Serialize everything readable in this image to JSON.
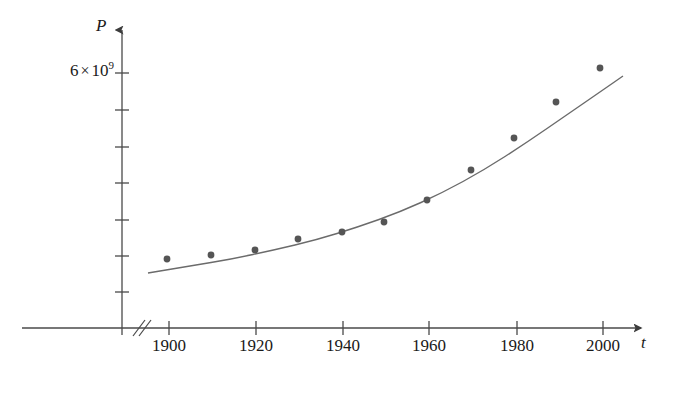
{
  "figure": {
    "background_color": "#ffffff",
    "axis_color": "#4a4a4a",
    "curve_color": "#6b6b6b",
    "point_color": "#555555",
    "text_color": "#1a1a1a"
  },
  "axes": {
    "y_axis_label": "P",
    "x_axis_label": "t",
    "x_axis_break": "//",
    "y_tick_labels": [
      {
        "id": "6e9",
        "mantissa": "6",
        "times": "×",
        "base": "10",
        "exponent": "9",
        "value": 6000000000
      }
    ],
    "x_tick_labels": [
      "1900",
      "1920",
      "1940",
      "1960",
      "1980",
      "2000"
    ]
  },
  "chart_data": {
    "type": "scatter",
    "title": "",
    "subtitle": "",
    "xlabel": "t",
    "ylabel": "P",
    "grid": false,
    "legend": null,
    "xlim": [
      1895,
      2005
    ],
    "ylim": [
      0,
      7000000000
    ],
    "x_ticks": [
      1900,
      1920,
      1940,
      1960,
      1980,
      2000
    ],
    "x_tick_labels": [
      "1900",
      "1920",
      "1940",
      "1960",
      "1980",
      "2000"
    ],
    "y_ticks": [
      1000000000,
      2000000000,
      3000000000,
      4000000000,
      5000000000,
      6000000000,
      7000000000
    ],
    "y_tick_labels": [
      "",
      "",
      "",
      "",
      "",
      "6 × 10⁹",
      ""
    ],
    "x_axis_broken": true,
    "series": [
      {
        "name": "World population",
        "type": "scatter",
        "x": [
          1900,
          1910,
          1920,
          1930,
          1940,
          1950,
          1960,
          1970,
          1980,
          1990,
          2000
        ],
        "y": [
          1650000000,
          1750000000,
          1860000000,
          2070000000,
          2300000000,
          2560000000,
          3040000000,
          3710000000,
          4450000000,
          5280000000,
          6080000000
        ],
        "point_pixels": [
          [
            167,
            259
          ],
          [
            211,
            255
          ],
          [
            255,
            250
          ],
          [
            298,
            239
          ],
          [
            342,
            232
          ],
          [
            384,
            222
          ],
          [
            427,
            200
          ],
          [
            471,
            170
          ],
          [
            514,
            138
          ],
          [
            556,
            102
          ],
          [
            600,
            68
          ]
        ]
      },
      {
        "name": "Fitted exponential model",
        "type": "line",
        "path_pixels": [
          [
            148,
            273
          ],
          [
            190,
            266
          ],
          [
            232,
            259
          ],
          [
            274,
            250
          ],
          [
            316,
            240
          ],
          [
            358,
            227
          ],
          [
            400,
            212
          ],
          [
            442,
            193
          ],
          [
            484,
            170
          ],
          [
            526,
            143
          ],
          [
            568,
            114
          ],
          [
            600,
            92
          ],
          [
            623,
            76
          ]
        ]
      }
    ]
  },
  "geometry": {
    "origin_x": 122,
    "baseline_y": 328,
    "y_axis_top": 23,
    "x_axis_right": 648,
    "x_tick_positions": [
      169,
      256,
      343,
      429,
      517,
      603
    ],
    "y_tick_positions": [
      73,
      110,
      147,
      183,
      220,
      256,
      292
    ],
    "break_marks_x": [
      136,
      146
    ]
  }
}
